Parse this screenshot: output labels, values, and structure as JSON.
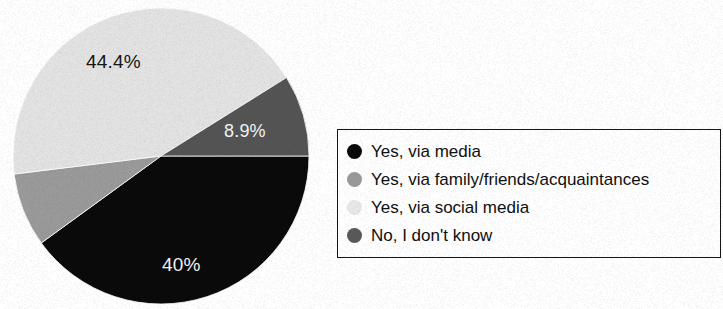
{
  "chart_data": {
    "type": "pie",
    "title": "",
    "subtitle": "",
    "xlabel": "",
    "ylabel": "",
    "grid": false,
    "legend_position": "right",
    "categories": [
      "Yes, via media",
      "Yes, via family/friends/acquaintances",
      "Yes, via social media",
      "No, I don't know"
    ],
    "values": [
      40,
      6.7,
      44.4,
      8.9
    ],
    "value_labels": [
      "40%",
      "",
      "44.4%",
      "8.9%"
    ],
    "colors": [
      "#0a0a0a",
      "#9a9a9a",
      "#e3e3e3",
      "#545454"
    ],
    "slices": [
      {
        "name": "Yes, via media",
        "value": 40,
        "label": "40%",
        "color": "#0a0a0a",
        "label_color": "#f4f4f4",
        "start_angle": 90,
        "end_angle": 234
      },
      {
        "name": "Yes, via family/friends/acquaintances",
        "value": 6.7,
        "label": "",
        "color": "#9a9a9a",
        "label_color": "#151515",
        "start_angle": 234,
        "end_angle": 263
      },
      {
        "name": "Yes, via social media",
        "value": 44.4,
        "label": "44.4%",
        "color": "#e3e3e3",
        "label_color": "#151515",
        "start_angle": 263,
        "end_angle": 58
      },
      {
        "name": "No, I don't know",
        "value": 8.9,
        "label": "8.9%",
        "color": "#545454",
        "label_color": "#f4f4f4",
        "start_angle": 58,
        "end_angle": 90
      }
    ]
  },
  "pie": {
    "labels": {
      "top": "44.4%",
      "right": "8.9%",
      "bottom": "40%"
    }
  },
  "legend": {
    "items": [
      {
        "label": "Yes, via media",
        "color": "#0a0a0a"
      },
      {
        "label": "Yes, via family/friends/acquaintances",
        "color": "#9a9a9a"
      },
      {
        "label": "Yes, via social media",
        "color": "#e8e8e8"
      },
      {
        "label": "No, I don't know",
        "color": "#595959"
      }
    ]
  }
}
